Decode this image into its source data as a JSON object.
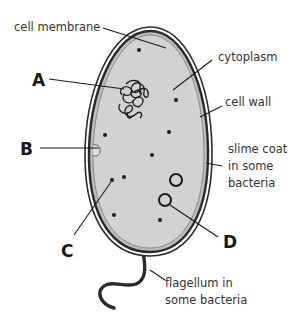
{
  "diagram": {
    "colors": {
      "cytoplasm": "#d2d2d2",
      "outline": "#2a2a2a",
      "slime_coat": "#ffffff",
      "text": "#333333"
    },
    "labels": {
      "cell_membrane": "cell membrane",
      "cytoplasm": "cytoplasm",
      "cell_wall": "cell wall",
      "slime_coat_line1": "slime coat",
      "slime_coat_line2": "in some",
      "slime_coat_line3": "bacteria",
      "flagellum_line1": "flagellum in",
      "flagellum_line2": "some bacteria"
    },
    "letters": {
      "A": "A",
      "B": "B",
      "C": "C",
      "D": "D"
    }
  }
}
